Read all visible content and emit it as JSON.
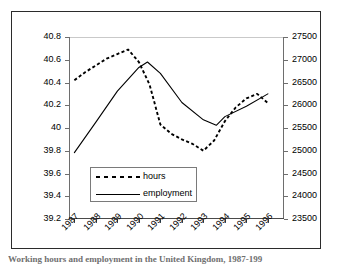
{
  "caption": "Working hours and employment in the United Kingdom, 1987-199",
  "legend": {
    "items": [
      {
        "label": "hours",
        "style": "dashed",
        "color": "#000000"
      },
      {
        "label": "employment",
        "style": "solid",
        "color": "#000000"
      }
    ]
  },
  "chart_data": {
    "type": "line",
    "title": "",
    "subtitle": "",
    "xlabel": "",
    "ylabel": "",
    "grid": false,
    "legend_position": "inside-lower-left",
    "x": [
      1987,
      1988,
      1989,
      1990,
      1991,
      1992,
      1993,
      1994,
      1995,
      1996
    ],
    "categories": [
      "1987",
      "1988",
      "1989",
      "1990",
      "1991",
      "1992",
      "1993",
      "1994",
      "1995",
      "1996"
    ],
    "axes": {
      "left": {
        "label": "hours",
        "ylim": [
          39.2,
          40.8
        ],
        "ticks": [
          39.2,
          39.4,
          39.6,
          39.8,
          40,
          40.2,
          40.4,
          40.6,
          40.8
        ],
        "tick_labels": [
          "39.2",
          "39.4",
          "39.6",
          "39.8",
          "40",
          "40.2",
          "40.4",
          "40.6",
          "40.8"
        ]
      },
      "right": {
        "label": "employment",
        "ylim": [
          23500,
          27500
        ],
        "ticks": [
          23500,
          24000,
          24500,
          25000,
          25500,
          26000,
          26500,
          27000,
          27500
        ],
        "tick_labels": [
          "23500",
          "24000",
          "24500",
          "25000",
          "25500",
          "26000",
          "26500",
          "27000",
          "27500"
        ]
      },
      "x": {
        "xlim": [
          1986.75,
          1996.75
        ],
        "ticks": [
          1987,
          1988,
          1989,
          1990,
          1991,
          1992,
          1993,
          1994,
          1995,
          1996
        ],
        "tick_labels": [
          "1987",
          "1988",
          "1989",
          "1990",
          "1991",
          "1992",
          "1993",
          "1994",
          "1995",
          "1996"
        ],
        "tick_label_rotation": -45
      }
    },
    "series": [
      {
        "name": "hours",
        "axis": "left",
        "style": "dashed",
        "color": "#000000",
        "x": [
          1987,
          1987.5,
          1988,
          1988.5,
          1989,
          1989.5,
          1990,
          1990.5,
          1991,
          1991.5,
          1992,
          1992.5,
          1993,
          1993.5,
          1994,
          1994.5,
          1995,
          1995.5,
          1996
        ],
        "values": [
          40.42,
          40.49,
          40.55,
          40.61,
          40.65,
          40.69,
          40.58,
          40.38,
          40.03,
          39.95,
          39.9,
          39.86,
          39.8,
          39.89,
          40.06,
          40.18,
          40.26,
          40.3,
          40.22
        ]
      },
      {
        "name": "employment",
        "axis": "right",
        "style": "solid",
        "color": "#000000",
        "x": [
          1987,
          1988,
          1989,
          1990,
          1990.4,
          1991,
          1992,
          1993,
          1993.6,
          1994,
          1995,
          1996
        ],
        "values": [
          24960,
          25630,
          26310,
          26830,
          26950,
          26700,
          26060,
          25680,
          25560,
          25750,
          25980,
          26250
        ]
      }
    ]
  }
}
